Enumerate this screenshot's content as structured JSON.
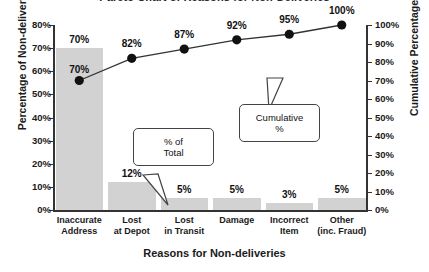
{
  "chart_data": {
    "type": "bar",
    "title": "Pareto Chart of Reasons for Non-Deliveries",
    "xlabel": "Reasons for Non-deliveries",
    "ylabel": "Percentage of Non-deliveries",
    "y2label": "Cumulative Percentage",
    "categories": [
      "Inaccurate\nAddress",
      "Lost\nat Depot",
      "Lost\nin Transit",
      "Damage",
      "Incorrect\nItem",
      "Other\n(inc. Fraud)"
    ],
    "category_lines": [
      [
        "Inaccurate",
        "Address"
      ],
      [
        "Lost",
        "at Depot"
      ],
      [
        "Lost",
        "in Transit"
      ],
      [
        "Damage",
        ""
      ],
      [
        "Incorrect",
        "Item"
      ],
      [
        "Other",
        "(inc. Fraud)"
      ]
    ],
    "series": [
      {
        "name": "% of Total",
        "type": "bar",
        "axis": "left",
        "values": [
          70,
          12,
          5,
          5,
          3,
          5
        ],
        "labels": [
          "70%",
          "12%",
          "5%",
          "5%",
          "3%",
          "5%"
        ]
      },
      {
        "name": "Cumulative %",
        "type": "line",
        "axis": "right",
        "values": [
          70,
          82,
          87,
          92,
          95,
          100
        ],
        "labels": [
          "70%",
          "82%",
          "87%",
          "92%",
          "95%",
          "100%"
        ]
      }
    ],
    "ylim": [
      0,
      80
    ],
    "y2lim": [
      0,
      100
    ],
    "yticks": [
      "0%",
      "10%",
      "20%",
      "30%",
      "40%",
      "50%",
      "60%",
      "70%",
      "80%"
    ],
    "ytick_values": [
      0,
      10,
      20,
      30,
      40,
      50,
      60,
      70,
      80
    ],
    "y2ticks": [
      "0%",
      "10%",
      "20%",
      "30%",
      "40%",
      "50%",
      "60%",
      "70%",
      "80%",
      "90%",
      "100%"
    ],
    "y2tick_values": [
      0,
      10,
      20,
      30,
      40,
      50,
      60,
      70,
      80,
      90,
      100
    ],
    "grid": false,
    "legend": "none",
    "bar_color": "#d2d2d2",
    "line_color": "#333333",
    "marker_color": "#111111",
    "annotations": [
      {
        "id": "pct-of-total",
        "line1": "% of",
        "line2": "Total",
        "points_to": "bar-label-2"
      },
      {
        "id": "cumulative-pct",
        "line1": "Cumulative",
        "line2": "%",
        "points_to": "point-4"
      }
    ]
  }
}
